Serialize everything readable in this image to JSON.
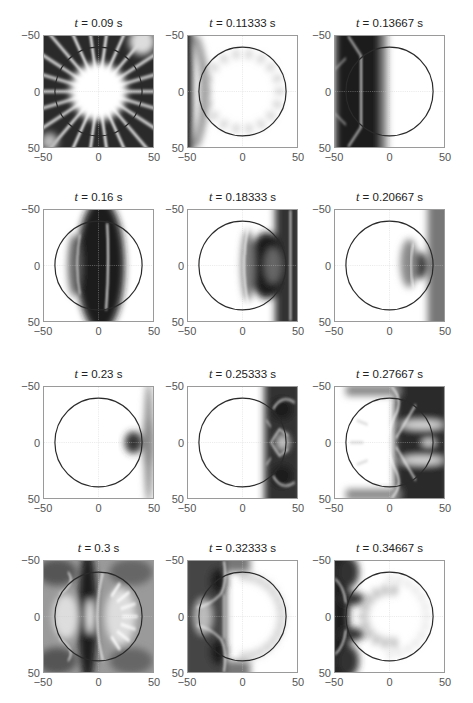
{
  "chart_data": [
    {
      "type": "heatmap",
      "title": "t = 0.09 s",
      "t": 0.09,
      "xlim": [
        -50,
        50
      ],
      "ylim": [
        -50,
        50
      ],
      "y_reversed": true,
      "xticks": [
        -50,
        0,
        50
      ],
      "yticks": [
        -50,
        0,
        50
      ],
      "circle_radius": 40,
      "grid": "crosshair at 0",
      "description": "radial spokes pattern, bright center, dark outer field"
    },
    {
      "type": "heatmap",
      "title": "t = 0.11333 s",
      "t": 0.11333,
      "xlim": [
        -50,
        50
      ],
      "ylim": [
        -50,
        50
      ],
      "y_reversed": true,
      "xticks": [
        -50,
        0,
        50
      ],
      "yticks": [
        -50,
        0,
        50
      ],
      "circle_radius": 40,
      "grid": "crosshair at 0",
      "description": "mostly bright, dark band at left edge, faint spokes at rim"
    },
    {
      "type": "heatmap",
      "title": "t = 0.13667 s",
      "t": 0.13667,
      "xlim": [
        -50,
        50
      ],
      "ylim": [
        -50,
        50
      ],
      "y_reversed": true,
      "xticks": [
        -50,
        0,
        50
      ],
      "yticks": [
        -50,
        0,
        50
      ],
      "circle_radius": 40,
      "grid": "crosshair at 0",
      "description": "dark vertical band x≈-35..-5, bright right half"
    },
    {
      "type": "heatmap",
      "title": "t = 0.16 s",
      "t": 0.16,
      "xlim": [
        -50,
        50
      ],
      "ylim": [
        -50,
        50
      ],
      "y_reversed": true,
      "xticks": [
        -50,
        0,
        50
      ],
      "yticks": [
        -50,
        0,
        50
      ],
      "circle_radius": 40,
      "grid": "crosshair at 0",
      "description": "dark vertical band centered near x≈0 with bright crest line at x≈8"
    },
    {
      "type": "heatmap",
      "title": "t = 0.18333 s",
      "t": 0.18333,
      "xlim": [
        -50,
        50
      ],
      "ylim": [
        -50,
        50
      ],
      "y_reversed": true,
      "xticks": [
        -50,
        0,
        50
      ],
      "yticks": [
        -50,
        0,
        50
      ],
      "circle_radius": 40,
      "grid": "crosshair at 0",
      "description": "curved dark front near x≈10..35, bright line near x≈45"
    },
    {
      "type": "heatmap",
      "title": "t = 0.20667 s",
      "t": 0.20667,
      "xlim": [
        -50,
        50
      ],
      "ylim": [
        -50,
        50
      ],
      "y_reversed": true,
      "xticks": [
        -50,
        0,
        50
      ],
      "yticks": [
        -50,
        0,
        50
      ],
      "circle_radius": 40,
      "grid": "crosshair at 0",
      "description": "focused dark spot near x≈28, grey field at right edge"
    },
    {
      "type": "heatmap",
      "title": "t = 0.23 s",
      "t": 0.23,
      "xlim": [
        -50,
        50
      ],
      "ylim": [
        -50,
        50
      ],
      "y_reversed": true,
      "xticks": [
        -50,
        0,
        50
      ],
      "yticks": [
        -50,
        0,
        50
      ],
      "circle_radius": 40,
      "grid": "crosshair at 0",
      "description": "dark focal spot at x≈35..50, y≈0"
    },
    {
      "type": "heatmap",
      "title": "t = 0.25333 s",
      "t": 0.25333,
      "xlim": [
        -50,
        50
      ],
      "ylim": [
        -50,
        50
      ],
      "y_reversed": true,
      "xticks": [
        -50,
        0,
        50
      ],
      "yticks": [
        -50,
        0,
        50
      ],
      "circle_radius": 40,
      "grid": "crosshair at 0",
      "description": "reflected dark lobes on right side x≈20..50"
    },
    {
      "type": "heatmap",
      "title": "t = 0.27667 s",
      "t": 0.27667,
      "xlim": [
        -50,
        50
      ],
      "ylim": [
        -50,
        50
      ],
      "y_reversed": true,
      "xticks": [
        -50,
        0,
        50
      ],
      "yticks": [
        -50,
        0,
        50
      ],
      "circle_radius": 40,
      "grid": "crosshair at 0",
      "description": "X-shaped bright crests, dark bands on right half"
    },
    {
      "type": "heatmap",
      "title": "t = 0.3 s",
      "t": 0.3,
      "xlim": [
        -50,
        50
      ],
      "ylim": [
        -50,
        50
      ],
      "y_reversed": true,
      "xticks": [
        -50,
        0,
        50
      ],
      "yticks": [
        -50,
        0,
        50
      ],
      "circle_radius": 40,
      "grid": "crosshair at 0",
      "description": "dark band x≈-10, spokes on right rim, grey outer field"
    },
    {
      "type": "heatmap",
      "title": "t = 0.32333 s",
      "t": 0.32333,
      "xlim": [
        -50,
        50
      ],
      "ylim": [
        -50,
        50
      ],
      "y_reversed": true,
      "xticks": [
        -50,
        0,
        50
      ],
      "yticks": [
        -50,
        0,
        50
      ],
      "circle_radius": 40,
      "grid": "crosshair at 0",
      "description": "dark left region with bright crests, spokes on right rim"
    },
    {
      "type": "heatmap",
      "title": "t = 0.34667 s",
      "t": 0.34667,
      "xlim": [
        -50,
        50
      ],
      "ylim": [
        -50,
        50
      ],
      "y_reversed": true,
      "xticks": [
        -50,
        0,
        50
      ],
      "yticks": [
        -50,
        0,
        50
      ],
      "circle_radius": 40,
      "grid": "crosshair at 0",
      "description": "dark band at left edge x≈-50..-30 with lobes, bright interior"
    }
  ],
  "panels": [
    {
      "t_label": "t",
      "title_rest": " = 0.09 s"
    },
    {
      "t_label": "t",
      "title_rest": " = 0.11333 s"
    },
    {
      "t_label": "t",
      "title_rest": " = 0.13667 s"
    },
    {
      "t_label": "t",
      "title_rest": " = 0.16 s"
    },
    {
      "t_label": "t",
      "title_rest": " = 0.18333 s"
    },
    {
      "t_label": "t",
      "title_rest": " = 0.20667 s"
    },
    {
      "t_label": "t",
      "title_rest": " = 0.23 s"
    },
    {
      "t_label": "t",
      "title_rest": " = 0.25333 s"
    },
    {
      "t_label": "t",
      "title_rest": " = 0.27667 s"
    },
    {
      "t_label": "t",
      "title_rest": " = 0.3 s"
    },
    {
      "t_label": "t",
      "title_rest": " = 0.32333 s"
    },
    {
      "t_label": "t",
      "title_rest": " = 0.34667 s"
    }
  ],
  "ticks": {
    "neg": "−50",
    "zero": "0",
    "pos": "50"
  }
}
